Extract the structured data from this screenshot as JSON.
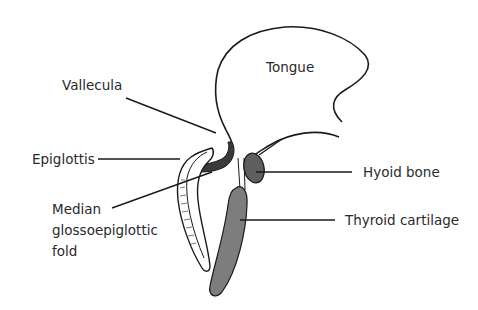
{
  "diagram": {
    "title_visible": false,
    "structures": {
      "tongue": "Tongue"
    },
    "labels": {
      "vallecula": "Vallecula",
      "epiglottis": "Epiglottis",
      "median_line1": "Median",
      "median_line2": "glossoepiglottic",
      "median_line3": "fold",
      "hyoid": "Hyoid bone",
      "thyroid": "Thyroid cartilage"
    },
    "colors": {
      "outline": "#1a1a1a",
      "hyoid_fill": "#5e5e5e",
      "thyroid_fill": "#7d7d7d",
      "fold_fill": "#3a3a3a",
      "background": "#ffffff"
    }
  }
}
